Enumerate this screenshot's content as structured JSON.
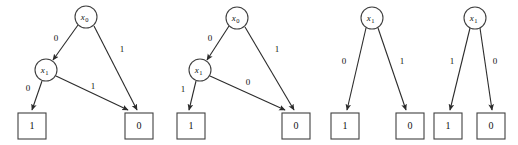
{
  "figure": {
    "background_color": "#ffffff",
    "stroke_color": "#404040",
    "text_color": "#111111"
  },
  "diagrams": [
    {
      "id": "bdd-1",
      "nodes": [
        {
          "id": "d1-root",
          "label": "x",
          "subscript": "0",
          "shape": "circle",
          "cx": 86,
          "cy": 17,
          "r": 11
        },
        {
          "id": "d1-x1",
          "label": "x",
          "subscript": "1",
          "shape": "circle",
          "cx": 46,
          "cy": 70,
          "r": 11
        }
      ],
      "leaves": [
        {
          "id": "d1-leaf-1",
          "value": "1",
          "x": 18,
          "y": 113,
          "w": 28,
          "h": 26
        },
        {
          "id": "d1-leaf-0",
          "value": "0",
          "x": 125,
          "y": 113,
          "w": 28,
          "h": 26
        }
      ],
      "edges": [
        {
          "from": "d1-root",
          "to": "d1-x1",
          "label": "0",
          "x1": 78,
          "y1": 25,
          "x2": 53,
          "y2": 60,
          "lx": 56,
          "ly": 39
        },
        {
          "from": "d1-root",
          "to": "d1-leaf-0",
          "label": "1",
          "x1": 94,
          "y1": 26,
          "x2": 137,
          "y2": 110,
          "lx": 122,
          "ly": 50
        },
        {
          "from": "d1-x1",
          "to": "d1-leaf-1",
          "label": "0",
          "x1": 42,
          "y1": 81,
          "x2": 32,
          "y2": 110,
          "lx": 28,
          "ly": 89
        },
        {
          "from": "d1-x1",
          "to": "d1-leaf-0",
          "label": "1",
          "x1": 56,
          "y1": 76,
          "x2": 128,
          "y2": 110,
          "lx": 93,
          "ly": 87
        }
      ]
    },
    {
      "id": "bdd-2",
      "nodes": [
        {
          "id": "d2-root",
          "label": "x",
          "subscript": "0",
          "shape": "circle",
          "cx": 237,
          "cy": 18,
          "r": 11
        },
        {
          "id": "d2-x1",
          "label": "x",
          "subscript": "1",
          "shape": "circle",
          "cx": 200,
          "cy": 70,
          "r": 11
        }
      ],
      "leaves": [
        {
          "id": "d2-leaf-1",
          "value": "1",
          "x": 177,
          "y": 113,
          "w": 28,
          "h": 26
        },
        {
          "id": "d2-leaf-0",
          "value": "0",
          "x": 282,
          "y": 113,
          "w": 28,
          "h": 26
        }
      ],
      "edges": [
        {
          "from": "d2-root",
          "to": "d2-x1",
          "label": "0",
          "x1": 229,
          "y1": 26,
          "x2": 207,
          "y2": 60,
          "lx": 210,
          "ly": 39
        },
        {
          "from": "d2-root",
          "to": "d2-leaf-0",
          "label": "1",
          "x1": 245,
          "y1": 27,
          "x2": 294,
          "y2": 110,
          "lx": 277,
          "ly": 50
        },
        {
          "from": "d2-x1",
          "to": "d2-leaf-1",
          "label": "1",
          "x1": 196,
          "y1": 81,
          "x2": 189,
          "y2": 110,
          "lx": 183,
          "ly": 90
        },
        {
          "from": "d2-x1",
          "to": "d2-leaf-0",
          "label": "0",
          "x1": 210,
          "y1": 76,
          "x2": 285,
          "y2": 110,
          "lx": 248,
          "ly": 83
        }
      ]
    },
    {
      "id": "bdd-3",
      "nodes": [
        {
          "id": "d3-root",
          "label": "x",
          "subscript": "1",
          "shape": "circle",
          "cx": 372,
          "cy": 18,
          "r": 11
        }
      ],
      "leaves": [
        {
          "id": "d3-leaf-1",
          "value": "1",
          "x": 331,
          "y": 113,
          "w": 28,
          "h": 26
        },
        {
          "id": "d3-leaf-0",
          "value": "0",
          "x": 396,
          "y": 113,
          "w": 28,
          "h": 26
        }
      ],
      "edges": [
        {
          "from": "d3-root",
          "to": "d3-leaf-1",
          "label": "0",
          "x1": 366,
          "y1": 28,
          "x2": 347,
          "y2": 110,
          "lx": 344,
          "ly": 62
        },
        {
          "from": "d3-root",
          "to": "d3-leaf-0",
          "label": "1",
          "x1": 378,
          "y1": 28,
          "x2": 406,
          "y2": 110,
          "lx": 402,
          "ly": 62
        }
      ]
    },
    {
      "id": "bdd-4",
      "nodes": [
        {
          "id": "d4-root",
          "label": "x",
          "subscript": "1",
          "shape": "circle",
          "cx": 475,
          "cy": 18,
          "r": 11
        }
      ],
      "leaves": [
        {
          "id": "d4-leaf-1",
          "value": "1",
          "x": 434,
          "y": 113,
          "w": 28,
          "h": 26
        },
        {
          "id": "d4-leaf-0",
          "value": "0",
          "x": 477,
          "y": 113,
          "w": 28,
          "h": 26
        }
      ],
      "edges": [
        {
          "from": "d4-root",
          "to": "d4-leaf-1",
          "label": "1",
          "x1": 470,
          "y1": 28,
          "x2": 450,
          "y2": 110,
          "lx": 452,
          "ly": 62
        },
        {
          "from": "d4-root",
          "to": "d4-leaf-0",
          "label": "0",
          "x1": 480,
          "y1": 28,
          "x2": 492,
          "y2": 110,
          "lx": 495,
          "ly": 62
        }
      ]
    }
  ]
}
